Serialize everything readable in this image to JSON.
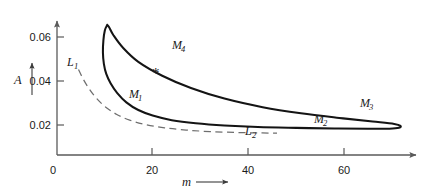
{
  "chart_data": {
    "type": "line",
    "title": "",
    "subtitle": "",
    "xlabel": "m",
    "ylabel": "A",
    "xlim": [
      0,
      75
    ],
    "ylim": [
      0,
      0.072
    ],
    "grid": false,
    "legend": "none",
    "x_ticks": [
      {
        "value": 0,
        "label": "0",
        "px": 57
      },
      {
        "value": 20,
        "label": "20",
        "px": 152
      },
      {
        "value": 40,
        "label": "40",
        "px": 248
      },
      {
        "value": 60,
        "label": "60",
        "px": 344
      }
    ],
    "y_ticks": [
      {
        "value": 0.02,
        "label": "0.02",
        "px": 125
      },
      {
        "value": 0.04,
        "label": "0.04",
        "px": 81
      },
      {
        "value": 0.06,
        "label": "0.06",
        "px": 37
      }
    ],
    "series": [
      {
        "name": "M-loop",
        "style": "solid",
        "closed": true,
        "color": "#141414",
        "description": "closed loop of steady-state amplitude A versus m",
        "points": [
          [
            10.5,
            0.0655
          ],
          [
            10.0,
            0.063
          ],
          [
            9.7,
            0.0585
          ],
          [
            9.6,
            0.053
          ],
          [
            9.8,
            0.0478
          ],
          [
            10.3,
            0.0432
          ],
          [
            11.2,
            0.039
          ],
          [
            12.6,
            0.0345
          ],
          [
            14.5,
            0.0303
          ],
          [
            17.0,
            0.0268
          ],
          [
            20.0,
            0.0243
          ],
          [
            24.0,
            0.0222
          ],
          [
            29.0,
            0.0208
          ],
          [
            35.0,
            0.0198
          ],
          [
            42.0,
            0.0191
          ],
          [
            50.0,
            0.0187
          ],
          [
            58.0,
            0.0184
          ],
          [
            65.0,
            0.0183
          ],
          [
            69.5,
            0.0183
          ],
          [
            71.5,
            0.0187
          ],
          [
            71.8,
            0.0196
          ],
          [
            70.5,
            0.0205
          ],
          [
            66.0,
            0.0216
          ],
          [
            59.0,
            0.0232
          ],
          [
            51.0,
            0.0253
          ],
          [
            43.0,
            0.0281
          ],
          [
            35.0,
            0.032
          ],
          [
            28.0,
            0.0368
          ],
          [
            22.0,
            0.0424
          ],
          [
            17.0,
            0.0487
          ],
          [
            13.8,
            0.0551
          ],
          [
            11.8,
            0.0608
          ],
          [
            10.9,
            0.0644
          ],
          [
            10.5,
            0.0655
          ]
        ]
      },
      {
        "name": "L-dashed",
        "style": "dashed",
        "closed": false,
        "color": "#6e6e6e",
        "description": "dashed backbone curve running from L1 to L2",
        "points": [
          [
            4.5,
            0.0452
          ],
          [
            5.5,
            0.0408
          ],
          [
            6.8,
            0.0362
          ],
          [
            8.3,
            0.032
          ],
          [
            10.2,
            0.0281
          ],
          [
            12.5,
            0.0248
          ],
          [
            15.2,
            0.0222
          ],
          [
            18.5,
            0.0202
          ],
          [
            22.5,
            0.0187
          ],
          [
            27.0,
            0.0177
          ],
          [
            32.0,
            0.017
          ],
          [
            37.5,
            0.0166
          ],
          [
            42.5,
            0.0164
          ],
          [
            46.0,
            0.0163
          ]
        ]
      }
    ],
    "markers": [
      {
        "name": "asterisk",
        "symbol": "*",
        "x": 22.5,
        "y": 0.042,
        "px": [
          152,
          72
        ]
      }
    ],
    "annotations": [
      {
        "name": "M1",
        "text": "M",
        "sub": "1",
        "px": [
          133,
          94
        ],
        "target_series": "M-loop"
      },
      {
        "name": "M2",
        "text": "M",
        "sub": "2",
        "px": [
          318,
          119
        ],
        "target_series": "M-loop"
      },
      {
        "name": "M3",
        "text": "M",
        "sub": "3",
        "px": [
          364,
          103
        ],
        "target_series": "M-loop"
      },
      {
        "name": "M4",
        "text": "M",
        "sub": "4",
        "px": [
          176,
          45
        ],
        "target_series": "M-loop"
      },
      {
        "name": "L1",
        "text": "L",
        "sub": "1",
        "px": [
          69,
          62
        ],
        "target_series": "L-dashed"
      },
      {
        "name": "L2",
        "text": "L",
        "sub": "2",
        "px": [
          248,
          131
        ],
        "target_series": "L-dashed"
      }
    ]
  },
  "axes": {
    "y_axis_label": "A",
    "x_axis_label": "m",
    "origin_label": "0"
  }
}
